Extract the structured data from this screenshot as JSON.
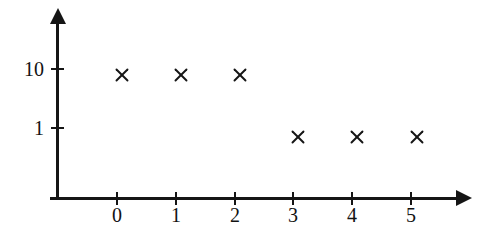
{
  "chart_data": {
    "type": "scatter",
    "title": "",
    "xlabel": "",
    "ylabel": "",
    "xlim": [
      -1.15,
      6.0
    ],
    "ylim": [
      0.3,
      30
    ],
    "yscale": "log",
    "xscale": "linear",
    "grid": false,
    "legend": null,
    "marker_style": "x",
    "marker_color": "#151515",
    "axis_color": "#151515",
    "background_color": "#ffffff",
    "x_tick_labels": [
      "0",
      "1",
      "2",
      "3",
      "4",
      "5"
    ],
    "x_ticks": [
      0,
      1,
      2,
      3,
      4,
      5
    ],
    "y_tick_labels": [
      "10",
      "1"
    ],
    "y_ticks": [
      10,
      1
    ],
    "x": [
      0,
      1,
      2,
      3,
      4,
      5
    ],
    "values": [
      8,
      8,
      8,
      0.7,
      0.7,
      0.7
    ],
    "points": [
      {
        "x": 0,
        "y": 8
      },
      {
        "x": 1,
        "y": 8
      },
      {
        "x": 2,
        "y": 8
      },
      {
        "x": 3,
        "y": 0.7
      },
      {
        "x": 4,
        "y": 0.7
      },
      {
        "x": 5,
        "y": 0.7
      }
    ],
    "annotations": []
  },
  "axes": {
    "x_axis_name": "x-axis",
    "y_axis_name": "y-axis",
    "x_arrow": "arrow-right",
    "y_arrow": "arrow-up"
  },
  "geometry": {
    "x_tick_px": [
      117,
      176,
      235,
      293,
      352,
      411
    ],
    "y_tick_px": [
      69,
      128
    ],
    "marker_px": [
      {
        "x": 122,
        "y": 75
      },
      {
        "x": 181,
        "y": 75
      },
      {
        "x": 240,
        "y": 75
      },
      {
        "x": 298,
        "y": 137
      },
      {
        "x": 357,
        "y": 137
      },
      {
        "x": 417,
        "y": 137
      }
    ]
  }
}
